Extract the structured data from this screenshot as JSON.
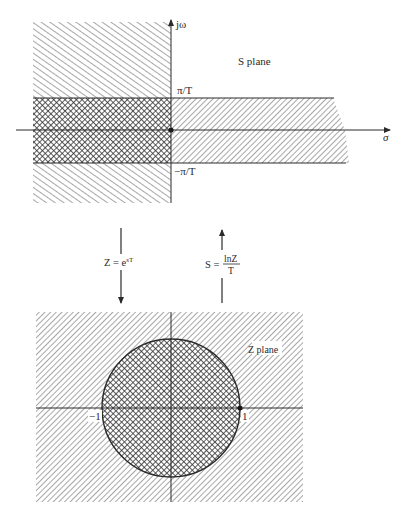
{
  "s_plane": {
    "title": "S plane",
    "imag_axis_label": "jω",
    "real_axis_label": "σ",
    "upper_band_label": "π/T",
    "lower_band_label": "−π/T"
  },
  "mappings": {
    "forward": {
      "lhs": "Z = e",
      "exponent": "sT",
      "direction": "down"
    },
    "inverse": {
      "lhs": "S =",
      "numerator": "lnZ",
      "denominator": "T",
      "direction": "up"
    }
  },
  "z_plane": {
    "title": "Z plane",
    "neg_one_label": "−1",
    "pos_one_label": "1"
  },
  "colors": {
    "ink": "#2a2a2a",
    "hatch": "#7a7a7a",
    "background": "#ffffff"
  }
}
